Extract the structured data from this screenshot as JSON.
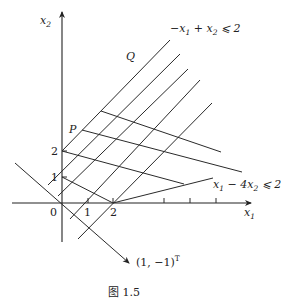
{
  "figure": {
    "caption": "图 1.5",
    "axes": {
      "x_label": "x",
      "x_label_sub": "1",
      "y_label": "x",
      "y_label_sub": "2",
      "origin_label": "0",
      "x_ticks": [
        "1",
        "2"
      ],
      "y_ticks": [
        "1",
        "2"
      ]
    },
    "points": {
      "P": "P",
      "Q": "Q"
    },
    "constraints": {
      "upper": {
        "part1": "−x",
        "sub1": "1",
        "part2": " + x",
        "sub2": "2",
        "part3": " ⩽ 2"
      },
      "lower": {
        "part1": "x",
        "sub1": "1",
        "part2": " − 4x",
        "sub2": "2",
        "part3": " ⩽ 2"
      }
    },
    "direction_vector": {
      "text": "(1, −1)",
      "sup": "T"
    }
  }
}
